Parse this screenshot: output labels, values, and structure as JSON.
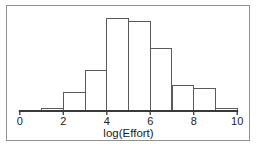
{
  "chart_data": {
    "type": "bar",
    "subtype": "histogram",
    "title": "",
    "xlabel": "log(Effort)",
    "ylabel": "",
    "xlim": [
      0,
      10
    ],
    "x_tick_labels": [
      "0",
      "2",
      "4",
      "6",
      "8",
      "10"
    ],
    "x_ticks": [
      0,
      2,
      4,
      6,
      8,
      10
    ],
    "bins": [
      {
        "x0": 1,
        "x1": 2
      },
      {
        "x0": 2,
        "x1": 3
      },
      {
        "x0": 3,
        "x1": 4
      },
      {
        "x0": 4,
        "x1": 5
      },
      {
        "x0": 5,
        "x1": 6
      },
      {
        "x0": 6,
        "x1": 7
      },
      {
        "x0": 7,
        "x1": 8
      },
      {
        "x0": 8,
        "x1": 9
      },
      {
        "x0": 9,
        "x1": 10
      }
    ],
    "relative_heights": [
      3,
      20,
      44,
      100,
      96,
      67,
      28,
      24,
      3
    ],
    "ylim": [
      0,
      105
    ],
    "y_axis_shown": false,
    "grid": false,
    "legend": null
  },
  "colors": {
    "background": "#ffffff",
    "frame": "#8f8f8f",
    "bar_fill": "#ffffff",
    "bar_stroke": "#5a5a5a",
    "axis": "#3a3a3a",
    "text": "#222222"
  }
}
